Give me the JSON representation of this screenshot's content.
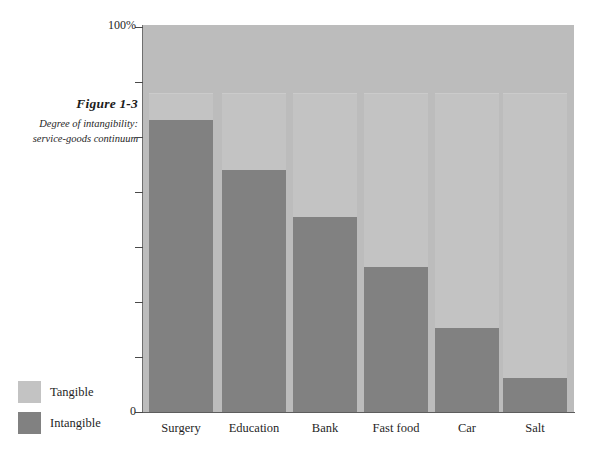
{
  "caption": {
    "title": "Figure 1-3",
    "subtitle_line1": "Degree of intangibility:",
    "subtitle_line2": "service-goods continuum"
  },
  "axis": {
    "y_top_label": "100%",
    "y_bottom_label": "0"
  },
  "legend": {
    "items": [
      {
        "label": "Tangible",
        "color": "#c3c3c3"
      },
      {
        "label": "Intangible",
        "color": "#818181"
      }
    ]
  },
  "chart_data": {
    "type": "bar",
    "stacked": true,
    "title": "Figure 1-3",
    "subtitle": "Degree of intangibility: service-goods continuum",
    "xlabel": "",
    "ylabel": "",
    "ylim": [
      0,
      100
    ],
    "grid": false,
    "legend_position": "bottom-left",
    "categories": [
      "Surgery",
      "Education",
      "Bank",
      "Fast food",
      "Car",
      "Salt"
    ],
    "series": [
      {
        "name": "Intangible",
        "color": "#818181",
        "values": [
          76,
          63,
          51,
          38,
          22,
          9
        ]
      },
      {
        "name": "Tangible",
        "color": "#c3c3c3",
        "values": [
          7,
          20,
          32,
          45,
          61,
          74
        ]
      }
    ],
    "column_top_percent": 83,
    "tick_count": 7
  }
}
